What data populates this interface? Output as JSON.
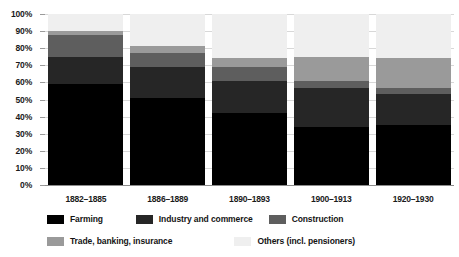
{
  "chart_data": {
    "type": "bar",
    "subtype": "100% stacked column",
    "title": "",
    "subtitle": "",
    "xlabel": "",
    "ylabel": "",
    "ylim": [
      0,
      100
    ],
    "y_unit": "%",
    "grid": true,
    "legend_position": "bottom",
    "categories": [
      "1882–1885",
      "1886–1889",
      "1890–1893",
      "1900–1913",
      "1920–1930"
    ],
    "ytick_labels": [
      "100%",
      "90%",
      "80%",
      "70%",
      "60%",
      "50%",
      "40%",
      "30%",
      "20%",
      "10%",
      "0%"
    ],
    "ytick_values": [
      100,
      90,
      80,
      70,
      60,
      50,
      40,
      30,
      20,
      10,
      0
    ],
    "series": [
      {
        "name": "Farming",
        "color": "#000000",
        "values": [
          59,
          51,
          42,
          34,
          35
        ]
      },
      {
        "name": "Industry and commerce",
        "color": "#262626",
        "values": [
          16,
          18,
          19,
          23,
          18
        ]
      },
      {
        "name": "Construction",
        "color": "#5e5e5e",
        "values": [
          13,
          8,
          8,
          4,
          4
        ]
      },
      {
        "name": "Trade, banking, insurance",
        "color": "#9a9a9a",
        "values": [
          2,
          4,
          5,
          14,
          17
        ]
      },
      {
        "name": "Others (incl. pensioners)",
        "color": "#efefef",
        "values": [
          10,
          19,
          26,
          25,
          26
        ]
      }
    ]
  },
  "legend": {
    "items": [
      {
        "label": "Farming",
        "color": "#000000"
      },
      {
        "label": "Industry and commerce",
        "color": "#262626"
      },
      {
        "label": "Construction",
        "color": "#5e5e5e"
      },
      {
        "label": "Trade, banking, insurance",
        "color": "#9a9a9a"
      },
      {
        "label": "Others (incl. pensioners)",
        "color": "#efefef"
      }
    ]
  },
  "colors": {
    "gridline": "#d8d8d8",
    "axis": "#8c8c8c",
    "text": "#1a1a1a",
    "background": "#ffffff"
  }
}
